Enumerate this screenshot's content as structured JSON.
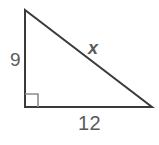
{
  "figure": {
    "type": "right-triangle-diagram",
    "background_color": "#ffffff",
    "stroke_color": "#3a3a3a",
    "label_color": "#5b5b5b",
    "right_angle_marker_color": "#8c8c8c"
  },
  "labels": {
    "vertical_leg": "9",
    "hypotenuse": "x",
    "horizontal_leg": "12"
  },
  "chart_data": {
    "type": "diagram",
    "shape": "right triangle",
    "title": "",
    "vertices": {
      "apex": [
        25,
        10
      ],
      "right_angle": [
        25,
        107
      ],
      "base_right": [
        152,
        107
      ]
    },
    "sides": [
      {
        "name": "vertical leg",
        "label": "9",
        "from": "apex",
        "to": "right_angle",
        "value": 9,
        "known": true
      },
      {
        "name": "horizontal leg",
        "label": "12",
        "from": "right_angle",
        "to": "base_right",
        "value": 12,
        "known": true
      },
      {
        "name": "hypotenuse",
        "label": "x",
        "from": "apex",
        "to": "base_right",
        "value": null,
        "known": false
      }
    ],
    "annotations": [
      {
        "kind": "right-angle-marker",
        "at": "right_angle",
        "size": 13
      }
    ]
  }
}
